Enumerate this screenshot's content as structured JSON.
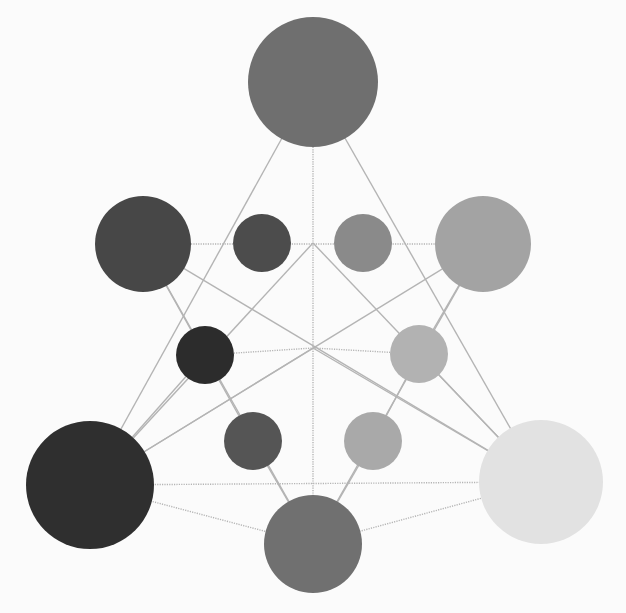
{
  "diagram": {
    "title": "",
    "nodes": [
      {
        "id": "top",
        "tone": "#6f6f6f",
        "size": "large"
      },
      {
        "id": "upper-left",
        "tone": "#474747",
        "size": "large"
      },
      {
        "id": "upper-right",
        "tone": "#a3a3a3",
        "size": "large"
      },
      {
        "id": "bottom-left",
        "tone": "#2f2f2f",
        "size": "large"
      },
      {
        "id": "bottom-center",
        "tone": "#707070",
        "size": "large"
      },
      {
        "id": "bottom-right",
        "tone": "#e2e2e2",
        "size": "large"
      },
      {
        "id": "inner-ul",
        "tone": "#4c4c4c",
        "size": "small"
      },
      {
        "id": "inner-ur",
        "tone": "#8a8a8a",
        "size": "small"
      },
      {
        "id": "inner-ml",
        "tone": "#2c2c2c",
        "size": "small"
      },
      {
        "id": "inner-mr",
        "tone": "#b2b2b2",
        "size": "small"
      },
      {
        "id": "inner-ll",
        "tone": "#555555",
        "size": "small"
      },
      {
        "id": "inner-lr",
        "tone": "#a9a9a9",
        "size": "small"
      }
    ],
    "edges": [
      {
        "from": "top",
        "to": "bottom-left",
        "style": "solid"
      },
      {
        "from": "top",
        "to": "bottom-right",
        "style": "solid"
      },
      {
        "from": "bottom-left",
        "to": "bottom-right",
        "style": "dotted"
      },
      {
        "from": "upper-left",
        "to": "upper-right",
        "style": "dotted"
      },
      {
        "from": "upper-left",
        "to": "bottom-center",
        "style": "solid"
      },
      {
        "from": "upper-right",
        "to": "bottom-center",
        "style": "solid"
      },
      {
        "from": "top",
        "to": "bottom-center",
        "style": "dotted"
      },
      {
        "from": "upper-left",
        "to": "bottom-right",
        "style": "solid"
      },
      {
        "from": "upper-right",
        "to": "bottom-left",
        "style": "solid"
      },
      {
        "from": "bottom-left",
        "to": "upper-center",
        "style": "solid"
      },
      {
        "from": "bottom-right",
        "to": "upper-center",
        "style": "solid"
      },
      {
        "from": "inner-ml",
        "to": "center",
        "style": "dotted"
      },
      {
        "from": "inner-mr",
        "to": "center",
        "style": "dotted"
      },
      {
        "from": "bottom-left",
        "to": "center",
        "style": "solid"
      },
      {
        "from": "bottom-right",
        "to": "center",
        "style": "solid"
      }
    ]
  }
}
